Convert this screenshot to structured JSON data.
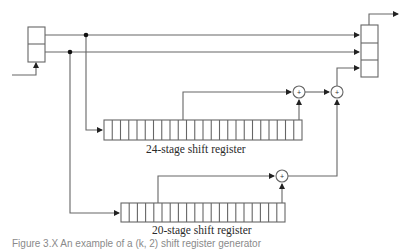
{
  "diagram": {
    "type": "shift-register keystream generator",
    "registers": [
      {
        "id": "input-register",
        "stages": 2
      },
      {
        "id": "output-register",
        "stages": 3
      },
      {
        "id": "register-24",
        "stages": 24,
        "label": "24-stage shift register"
      },
      {
        "id": "register-20",
        "stages": 20,
        "label": "20-stage shift register"
      }
    ],
    "combiners": [
      {
        "id": "xor-1",
        "symbol": "+"
      },
      {
        "id": "xor-2",
        "symbol": "+"
      },
      {
        "id": "xor-3",
        "symbol": "+"
      }
    ]
  },
  "labels": {
    "reg24": "24-stage shift register",
    "reg20": "20-stage shift register",
    "xor_symbol": "+",
    "caption": "Figure 3.X   An example of a (k, 2) shift register generator"
  },
  "colors": {
    "line": "#555555",
    "dot": "#111111",
    "box": "#555555"
  }
}
